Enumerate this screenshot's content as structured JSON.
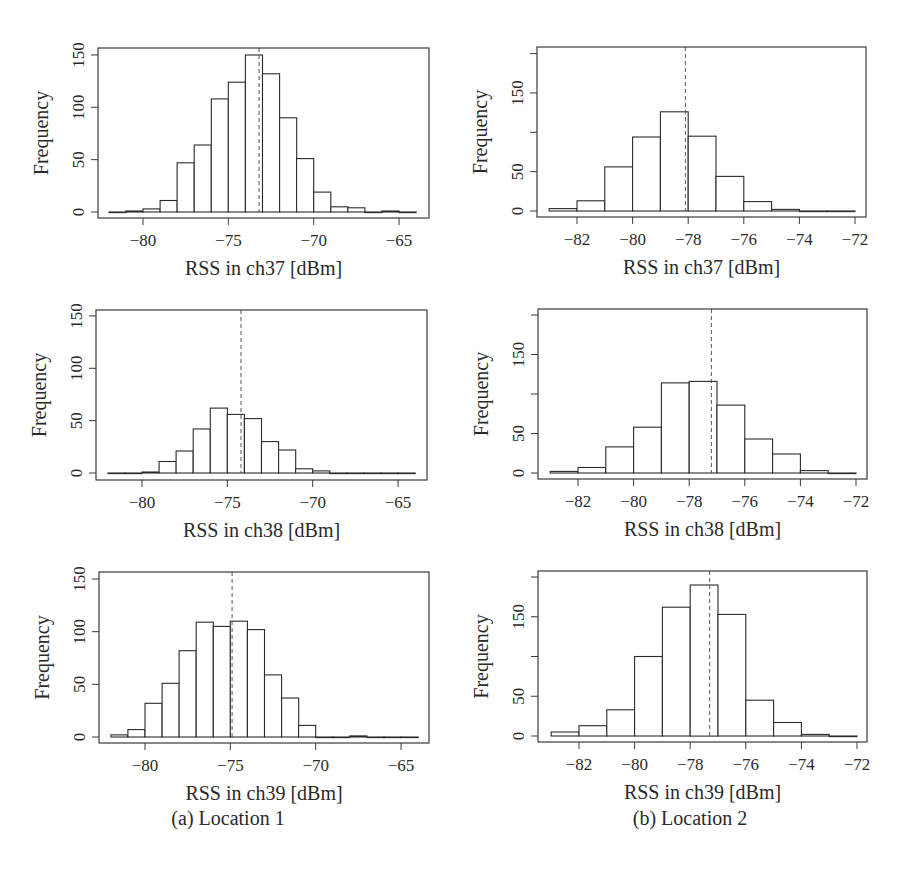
{
  "figure": {
    "captions": [
      {
        "label": "(a) Location 1",
        "x": 228,
        "y": 822
      },
      {
        "label": "(b) Location 2",
        "x": 690,
        "y": 822
      }
    ],
    "colors": {
      "axis": "#3a3a3a",
      "bar_edge": "#2a2a2a",
      "bar_fill": "#ffffff",
      "mean_line": "#555555"
    }
  },
  "chart_data": [
    {
      "type": "bar",
      "id": "loc1-ch37",
      "title": "",
      "xlabel": "RSS in ch37 [dBm]",
      "ylabel": "Frequency",
      "location": "Location 1",
      "bin_edges": [
        -82,
        -81,
        -80,
        -79,
        -78,
        -77,
        -76,
        -75,
        -74,
        -73,
        -72,
        -71,
        -70,
        -69,
        -68,
        -67,
        -66,
        -65,
        -64
      ],
      "values": [
        0,
        1,
        3,
        11,
        47,
        64,
        108,
        124,
        150,
        132,
        90,
        51,
        19,
        5,
        4,
        0,
        1,
        0
      ],
      "mean": -73.2,
      "xlim": [
        -83,
        -63.5
      ],
      "ylim": [
        0,
        150
      ],
      "xticks": [
        -80,
        -75,
        -70,
        -65
      ],
      "yticks": [
        0,
        50,
        100,
        150
      ],
      "ytick_labels": [
        "0",
        "50",
        "100",
        "150"
      ],
      "grid": false,
      "layout": {
        "box": [
          98,
          48,
          429,
          218
        ],
        "x0px": 143,
        "xscale": 17.07,
        "x0val": -80,
        "y0px": 212,
        "yscale": 1.047
      }
    },
    {
      "type": "bar",
      "id": "loc2-ch37",
      "title": "",
      "xlabel": "RSS in ch37 [dBm]",
      "ylabel": "Frequency",
      "location": "Location 2",
      "bin_edges": [
        -83,
        -82,
        -81,
        -80,
        -79,
        -78,
        -77,
        -76,
        -75,
        -74,
        -73,
        -72
      ],
      "values": [
        3,
        13,
        56,
        94,
        126,
        95,
        44,
        12,
        2,
        0,
        0
      ],
      "mean": -78.1,
      "xlim": [
        -83.5,
        -71.5
      ],
      "ylim": [
        0,
        200
      ],
      "xticks": [
        -82,
        -80,
        -78,
        -76,
        -74,
        -72
      ],
      "yticks": [
        0,
        50,
        100,
        150,
        200
      ],
      "ytick_labels": [
        "0",
        "50",
        "",
        "150",
        ""
      ],
      "grid": false,
      "layout": {
        "box": [
          537,
          47,
          866,
          217
        ],
        "x0px": 577,
        "xscale": 27.8,
        "x0val": -82,
        "y0px": 211,
        "yscale": 0.787
      }
    },
    {
      "type": "bar",
      "id": "loc1-ch38",
      "title": "",
      "xlabel": "RSS in ch38 [dBm]",
      "ylabel": "Frequency",
      "location": "Location 1",
      "bin_edges": [
        -82,
        -81,
        -80,
        -79,
        -78,
        -77,
        -76,
        -75,
        -74,
        -73,
        -72,
        -71,
        -70,
        -69,
        -68,
        -67,
        -66,
        -65,
        -64
      ],
      "values": [
        0,
        0,
        1,
        11,
        21,
        42,
        62,
        56,
        52,
        30,
        22,
        4,
        2,
        0,
        0,
        0,
        0,
        0
      ],
      "mean": -74.2,
      "xlim": [
        -83,
        -63.5
      ],
      "ylim": [
        0,
        150
      ],
      "xticks": [
        -80,
        -75,
        -70,
        -65
      ],
      "yticks": [
        0,
        50,
        100,
        150
      ],
      "ytick_labels": [
        "0",
        "50",
        "100",
        "150"
      ],
      "grid": false,
      "layout": {
        "box": [
          96,
          310,
          427,
          480
        ],
        "x0px": 142,
        "xscale": 17.07,
        "x0val": -80,
        "y0px": 473,
        "yscale": 1.047
      }
    },
    {
      "type": "bar",
      "id": "loc2-ch38",
      "title": "",
      "xlabel": "RSS in ch38 [dBm]",
      "ylabel": "Frequency",
      "location": "Location 2",
      "bin_edges": [
        -83,
        -82,
        -81,
        -80,
        -79,
        -78,
        -77,
        -76,
        -75,
        -74,
        -73,
        -72
      ],
      "values": [
        2,
        7,
        33,
        58,
        114,
        116,
        86,
        43,
        24,
        3,
        0
      ],
      "mean": -77.2,
      "xlim": [
        -83.5,
        -71.5
      ],
      "ylim": [
        0,
        200
      ],
      "xticks": [
        -82,
        -80,
        -78,
        -76,
        -74,
        -72
      ],
      "yticks": [
        0,
        50,
        100,
        150,
        200
      ],
      "ytick_labels": [
        "0",
        "50",
        "",
        "150",
        ""
      ],
      "grid": false,
      "layout": {
        "box": [
          538,
          309,
          867,
          479
        ],
        "x0px": 578,
        "xscale": 27.8,
        "x0val": -82,
        "y0px": 473,
        "yscale": 0.79
      }
    },
    {
      "type": "bar",
      "id": "loc1-ch39",
      "title": "",
      "xlabel": "RSS in ch39 [dBm]",
      "ylabel": "Frequency",
      "location": "Location 1",
      "bin_edges": [
        -82,
        -81,
        -80,
        -79,
        -78,
        -77,
        -76,
        -75,
        -74,
        -73,
        -72,
        -71,
        -70,
        -69,
        -68,
        -67,
        -66,
        -65,
        -64
      ],
      "values": [
        2,
        7,
        32,
        51,
        82,
        109,
        105,
        110,
        102,
        59,
        37,
        11,
        0,
        0,
        1,
        0,
        0,
        0
      ],
      "mean": -74.9,
      "xlim": [
        -83,
        -63.5
      ],
      "ylim": [
        0,
        150
      ],
      "xticks": [
        -80,
        -75,
        -70,
        -65
      ],
      "yticks": [
        0,
        50,
        100,
        150
      ],
      "ytick_labels": [
        "0",
        "50",
        "100",
        "150"
      ],
      "grid": false,
      "layout": {
        "box": [
          99,
          572,
          429,
          743
        ],
        "x0px": 145,
        "xscale": 17.07,
        "x0val": -80,
        "y0px": 737,
        "yscale": 1.053
      }
    },
    {
      "type": "bar",
      "id": "loc2-ch39",
      "title": "",
      "xlabel": "RSS in ch39 [dBm]",
      "ylabel": "Frequency",
      "location": "Location 2",
      "bin_edges": [
        -83,
        -82,
        -81,
        -80,
        -79,
        -78,
        -77,
        -76,
        -75,
        -74,
        -73,
        -72
      ],
      "values": [
        5,
        13,
        33,
        100,
        162,
        190,
        153,
        45,
        17,
        2,
        0
      ],
      "mean": -77.3,
      "xlim": [
        -83.5,
        -71.5
      ],
      "ylim": [
        0,
        200
      ],
      "xticks": [
        -82,
        -80,
        -78,
        -76,
        -74,
        -72
      ],
      "yticks": [
        0,
        50,
        100,
        150,
        200
      ],
      "ytick_labels": [
        "0",
        "50",
        "",
        "150",
        ""
      ],
      "grid": false,
      "layout": {
        "box": [
          538,
          571,
          867,
          742
        ],
        "x0px": 579,
        "xscale": 27.8,
        "x0val": -82,
        "y0px": 736,
        "yscale": 0.795
      }
    }
  ]
}
